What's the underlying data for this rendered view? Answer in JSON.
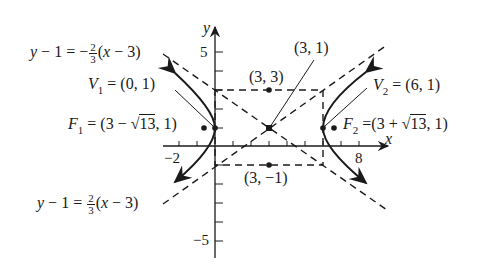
{
  "diagram": {
    "type": "hyperbola",
    "center": "(3, 1)",
    "vertices": {
      "v1": "(0, 1)",
      "v2": "(6, 1)"
    },
    "foci": {
      "f1": "(3 − √13, 1)",
      "f2": "(3 + √13, 1)"
    },
    "box_points": {
      "top": "(3, 3)",
      "bottom": "(3, −1)"
    },
    "asymptotes": {
      "negative": {
        "lhs": "y − 1 = −",
        "num": "2",
        "den": "3",
        "rhs": "(x − 3)"
      },
      "positive": {
        "lhs": "y − 1 = ",
        "num": "2",
        "den": "3",
        "rhs": "(x − 3)"
      }
    },
    "axes": {
      "x_label": "x",
      "y_label": "y",
      "x_ticks": [
        "−2",
        "8"
      ],
      "y_ticks": [
        "5",
        "−5"
      ]
    }
  },
  "labels": {
    "center": "(3, 1)",
    "top": "(3, 3)",
    "bottom": "(3, −1)",
    "v1_name": "V",
    "v1_sub": "1",
    "v1_val": " = (0, 1)",
    "v2_name": "V",
    "v2_sub": "2",
    "v2_val": " = (6, 1)",
    "f1_name": "F",
    "f1_sub": "1",
    "f1_pre": " = (3 − √",
    "f1_rad": "13",
    "f1_post": ", 1)",
    "f2_name": "F",
    "f2_sub": "2",
    "f2_pre": " =(3 + √",
    "f2_rad": "13",
    "f2_post": ", 1)"
  }
}
